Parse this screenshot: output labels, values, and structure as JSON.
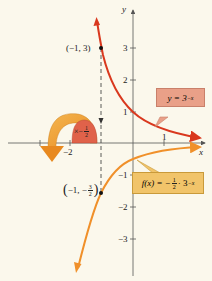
{
  "diagram": {
    "axes": {
      "x_label": "x",
      "y_label": "y",
      "x_ticks": [
        {
          "label": "−2",
          "value": -2
        },
        {
          "label": "1",
          "value": 1
        }
      ],
      "y_ticks": [
        {
          "label": "3",
          "value": 3
        },
        {
          "label": "2",
          "value": 2
        },
        {
          "label": "1",
          "value": 1
        },
        {
          "label": "−1",
          "value": -1
        },
        {
          "label": "−2",
          "value": -2
        },
        {
          "label": "−3",
          "value": -3
        }
      ]
    },
    "curves": [
      {
        "name": "y = 3^{-x}",
        "color": "#d9381e"
      },
      {
        "name": "f(x) = -1/2 · 3^{-x}",
        "color": "#f0902a"
      }
    ],
    "points": {
      "upper": {
        "label": "(−1, 3)"
      },
      "lower": {
        "label_prefix": "−1, −",
        "num": "3",
        "den": "2"
      }
    },
    "callouts": {
      "red": {
        "prefix": "y = 3",
        "exp": "−x"
      },
      "orange": {
        "prefix": "f(x) = −",
        "num": "1",
        "den": "2",
        "mid": " · 3",
        "exp": "−x"
      },
      "reflect": {
        "prefix": "×−",
        "num": "1",
        "den": "2"
      }
    },
    "colors": {
      "background": "#fbf8ec",
      "red_curve": "#d9381e",
      "orange_curve": "#f0902a",
      "red_box": "#e9a088",
      "orange_box": "#f1c46a",
      "axis": "#555555"
    }
  }
}
